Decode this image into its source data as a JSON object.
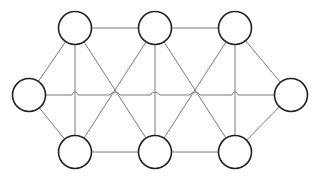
{
  "diagram": {
    "type": "graph",
    "node_count": 8,
    "edge_color": "#7a7a7a",
    "node_stroke": "#222222",
    "node_fill": "#ffffff",
    "nodes": [
      {
        "id": "n1",
        "label": "",
        "x": 75,
        "y": 28
      },
      {
        "id": "n2",
        "label": "",
        "x": 155,
        "y": 28
      },
      {
        "id": "n3",
        "label": "",
        "x": 235,
        "y": 28
      },
      {
        "id": "n4",
        "label": "",
        "x": 29,
        "y": 95
      },
      {
        "id": "n5",
        "label": "",
        "x": 291,
        "y": 95
      },
      {
        "id": "n6",
        "label": "",
        "x": 75,
        "y": 152
      },
      {
        "id": "n7",
        "label": "",
        "x": 155,
        "y": 152
      },
      {
        "id": "n8",
        "label": "",
        "x": 235,
        "y": 152
      }
    ],
    "edges": [
      [
        "n1",
        "n2"
      ],
      [
        "n2",
        "n3"
      ],
      [
        "n6",
        "n7"
      ],
      [
        "n7",
        "n8"
      ],
      [
        "n4",
        "n1"
      ],
      [
        "n4",
        "n6"
      ],
      [
        "n5",
        "n3"
      ],
      [
        "n5",
        "n8"
      ],
      [
        "n4",
        "n5"
      ],
      [
        "n1",
        "n6"
      ],
      [
        "n2",
        "n7"
      ],
      [
        "n3",
        "n8"
      ],
      [
        "n1",
        "n7"
      ],
      [
        "n2",
        "n6"
      ],
      [
        "n2",
        "n8"
      ],
      [
        "n3",
        "n7"
      ]
    ]
  }
}
